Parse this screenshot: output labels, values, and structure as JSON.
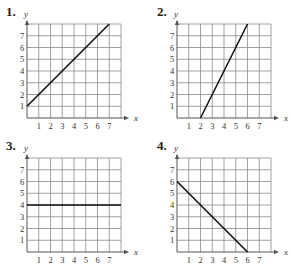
{
  "chart_data": [
    {
      "id": "1",
      "label": "1.",
      "type": "line",
      "xlabel": "x",
      "ylabel": "y",
      "x_ticks": [
        "1",
        "2",
        "3",
        "4",
        "5",
        "6",
        "7"
      ],
      "y_ticks": [
        "1",
        "2",
        "3",
        "4",
        "5",
        "6",
        "7"
      ],
      "xlim": [
        0,
        8
      ],
      "ylim": [
        0,
        8
      ],
      "grid": true,
      "series": [
        {
          "name": "line",
          "points": [
            [
              0,
              1
            ],
            [
              7,
              8
            ]
          ]
        }
      ]
    },
    {
      "id": "2",
      "label": "2.",
      "type": "line",
      "xlabel": "x",
      "ylabel": "y",
      "x_ticks": [
        "1",
        "2",
        "3",
        "4",
        "5",
        "6",
        "7"
      ],
      "y_ticks": [
        "1",
        "2",
        "3",
        "4",
        "5",
        "6",
        "7"
      ],
      "xlim": [
        0,
        8
      ],
      "ylim": [
        0,
        8
      ],
      "grid": true,
      "series": [
        {
          "name": "line",
          "points": [
            [
              2,
              0
            ],
            [
              6,
              8
            ]
          ]
        }
      ]
    },
    {
      "id": "3",
      "label": "3.",
      "type": "line",
      "xlabel": "x",
      "ylabel": "y",
      "x_ticks": [
        "1",
        "2",
        "3",
        "4",
        "5",
        "6",
        "7"
      ],
      "y_ticks": [
        "1",
        "2",
        "3",
        "4",
        "5",
        "6",
        "7"
      ],
      "xlim": [
        0,
        8
      ],
      "ylim": [
        0,
        8
      ],
      "grid": true,
      "series": [
        {
          "name": "line",
          "points": [
            [
              0,
              4
            ],
            [
              8,
              4
            ]
          ]
        }
      ]
    },
    {
      "id": "4",
      "label": "4.",
      "type": "line",
      "xlabel": "x",
      "ylabel": "y",
      "x_ticks": [
        "1",
        "2",
        "3",
        "4",
        "5",
        "6",
        "7"
      ],
      "y_ticks": [
        "1",
        "2",
        "3",
        "4",
        "5",
        "6",
        "7"
      ],
      "xlim": [
        0,
        8
      ],
      "ylim": [
        0,
        8
      ],
      "grid": true,
      "series": [
        {
          "name": "line",
          "points": [
            [
              0,
              6
            ],
            [
              6,
              0
            ]
          ]
        }
      ]
    }
  ],
  "colors": {
    "grid": "#8a8a8a",
    "axis": "#555555",
    "line": "#111111",
    "text": "#333333"
  }
}
